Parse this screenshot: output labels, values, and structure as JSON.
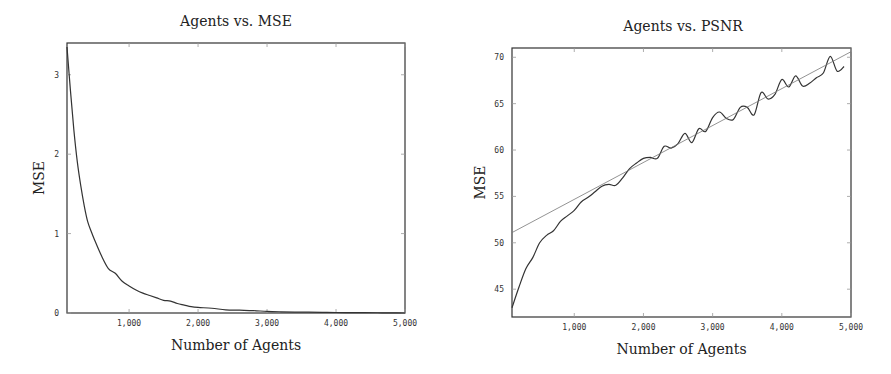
{
  "chart_data": [
    {
      "type": "line",
      "title": "Agents vs. MSE",
      "xlabel": "Number of Agents",
      "ylabel": "MSE",
      "xlim": [
        100,
        5000
      ],
      "ylim": [
        0,
        3.4
      ],
      "x_ticks": [
        "1,000",
        "2,000",
        "3,000",
        "4,000",
        "5,000"
      ],
      "y_ticks": [
        "0",
        "1",
        "2",
        "3"
      ],
      "grid": false,
      "legend": null,
      "series": [
        {
          "name": "MSE",
          "x": [
            100,
            150,
            200,
            250,
            300,
            350,
            400,
            450,
            500,
            600,
            700,
            800,
            900,
            1000,
            1100,
            1200,
            1300,
            1400,
            1500,
            1600,
            1700,
            1800,
            1900,
            2000,
            2200,
            2400,
            2600,
            2800,
            3000,
            3200,
            3400,
            3600,
            3800,
            4000,
            4200,
            4400,
            4600,
            4800,
            5000
          ],
          "values": [
            3.35,
            2.8,
            2.3,
            1.9,
            1.6,
            1.35,
            1.15,
            1.03,
            0.92,
            0.72,
            0.56,
            0.5,
            0.4,
            0.34,
            0.29,
            0.25,
            0.22,
            0.19,
            0.16,
            0.15,
            0.12,
            0.1,
            0.08,
            0.07,
            0.06,
            0.04,
            0.035,
            0.03,
            0.02,
            0.015,
            0.012,
            0.01,
            0.008,
            0.006,
            0.005,
            0.004,
            0.003,
            0.002,
            0.0
          ]
        }
      ]
    },
    {
      "type": "line",
      "title": "Agents vs. PSNR",
      "xlabel": "Number of Agents",
      "ylabel": "MSE",
      "xlim": [
        100,
        5000
      ],
      "ylim": [
        42,
        71
      ],
      "x_ticks": [
        "1,000",
        "2,000",
        "3,000",
        "4,000",
        "5,000"
      ],
      "y_ticks": [
        "45",
        "50",
        "55",
        "60",
        "65",
        "70"
      ],
      "grid": false,
      "legend": null,
      "series": [
        {
          "name": "PSNR",
          "x": [
            100,
            200,
            300,
            400,
            500,
            600,
            700,
            800,
            900,
            1000,
            1100,
            1200,
            1300,
            1400,
            1500,
            1600,
            1700,
            1800,
            1900,
            2000,
            2100,
            2200,
            2300,
            2400,
            2500,
            2600,
            2700,
            2800,
            2900,
            3000,
            3100,
            3200,
            3300,
            3400,
            3500,
            3600,
            3700,
            3800,
            3900,
            4000,
            4100,
            4200,
            4300,
            4400,
            4500,
            4600,
            4700,
            4800,
            4900
          ],
          "values": [
            43.0,
            45.2,
            47.2,
            48.4,
            50.0,
            50.8,
            51.3,
            52.3,
            52.9,
            53.5,
            54.4,
            54.9,
            55.5,
            56.1,
            56.3,
            56.2,
            57.0,
            58.0,
            58.6,
            59.1,
            59.2,
            59.1,
            60.4,
            60.2,
            60.7,
            61.8,
            60.8,
            62.3,
            62.0,
            63.5,
            64.1,
            63.4,
            63.3,
            64.6,
            64.6,
            63.8,
            66.2,
            65.5,
            66.0,
            67.6,
            66.8,
            68.0,
            66.9,
            67.2,
            67.8,
            68.3,
            70.1,
            68.5,
            69.0
          ]
        },
        {
          "name": "Linear fit",
          "x": [
            100,
            5000
          ],
          "values": [
            51.1,
            70.6
          ]
        }
      ]
    }
  ]
}
